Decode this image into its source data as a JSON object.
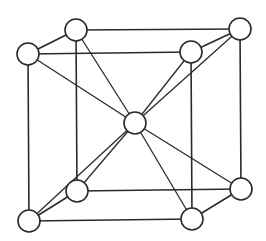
{
  "diagram": {
    "type": "body-centered cubic unit cell",
    "colors": {
      "line": "#2a2a2a",
      "atom_fill": "#ffffff",
      "background": "#ffffff"
    },
    "atoms": [
      {
        "id": "back-top-left",
        "x": 76,
        "y": 30,
        "r": 11
      },
      {
        "id": "back-top-right",
        "x": 240,
        "y": 29,
        "r": 11
      },
      {
        "id": "back-bottom-left",
        "x": 77,
        "y": 191,
        "r": 11
      },
      {
        "id": "back-bottom-right",
        "x": 241,
        "y": 189,
        "r": 11
      },
      {
        "id": "front-top-left",
        "x": 28,
        "y": 54,
        "r": 11
      },
      {
        "id": "front-top-right",
        "x": 191,
        "y": 52,
        "r": 11
      },
      {
        "id": "front-bottom-left",
        "x": 29,
        "y": 221,
        "r": 11
      },
      {
        "id": "front-bottom-right",
        "x": 192,
        "y": 219,
        "r": 11
      },
      {
        "id": "body-center",
        "x": 135,
        "y": 123,
        "r": 11
      }
    ]
  }
}
